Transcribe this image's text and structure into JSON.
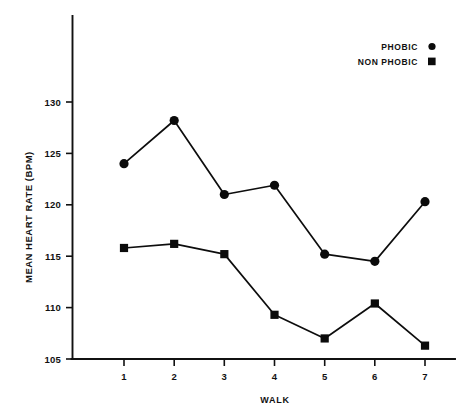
{
  "chart_data": {
    "type": "line",
    "title": "",
    "subtitle": "",
    "xlabel": "WALK",
    "ylabel": "MEAN HEART RATE (BPM)",
    "x": [
      1,
      2,
      3,
      4,
      5,
      6,
      7
    ],
    "categories": [
      "1",
      "2",
      "3",
      "4",
      "5",
      "6",
      "7"
    ],
    "xtick_labels": [
      "1",
      "2",
      "3",
      "4",
      "5",
      "6",
      "7"
    ],
    "ytick_labels": [
      "105",
      "110",
      "115",
      "120",
      "125",
      "130"
    ],
    "yticks": [
      105,
      110,
      115,
      120,
      125,
      130
    ],
    "xlim": [
      0.55,
      7.6
    ],
    "ylim": [
      105,
      130
    ],
    "grid": false,
    "legend_position": "top-right",
    "series": [
      {
        "name": "PHOBIC",
        "marker": "circle",
        "color": "#0b0b0b",
        "values": [
          124.0,
          128.2,
          121.0,
          121.9,
          115.2,
          114.5,
          120.3
        ]
      },
      {
        "name": "NON PHOBIC",
        "marker": "square",
        "color": "#0b0b0b",
        "values": [
          115.8,
          116.2,
          115.2,
          109.3,
          107.0,
          110.4,
          106.3
        ]
      }
    ]
  },
  "legend": {
    "entries": [
      {
        "label": "PHOBIC",
        "marker": "circle-marker-icon"
      },
      {
        "label": "NON PHOBIC",
        "marker": "square-marker-icon"
      }
    ]
  },
  "axes": {
    "y_axis_title": "MEAN HEART RATE (BPM)",
    "x_axis_title": "WALK"
  },
  "colors": {
    "ink": "#0b0b0b",
    "axis": "#111111",
    "background": "#ffffff"
  }
}
